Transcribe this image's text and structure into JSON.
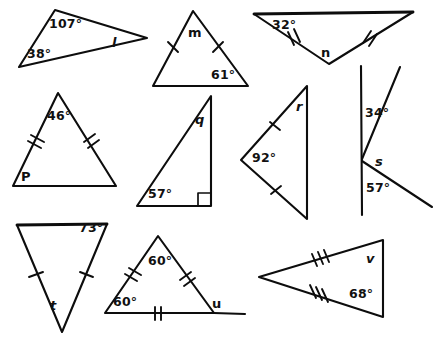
{
  "worksheet": {
    "width": 440,
    "height": 339,
    "background_color": "#ffffff",
    "ink_color": "#0d0d0d",
    "description": "Hand-drawn geometry worksheet with ten figures: nine triangles and one angle-pair diagram, each labeled with known angle measures and one unknown angle named by a letter."
  },
  "figures": [
    {
      "id": "figure-l",
      "type": "scalene-triangle",
      "unknown": "l",
      "known_angles": [
        "107°",
        "38°"
      ],
      "tick_marks": "none",
      "labels": {
        "angle_1": "107°",
        "angle_2": "38°",
        "unknown": "l"
      }
    },
    {
      "id": "figure-m",
      "type": "isosceles-triangle",
      "unknown": "m",
      "known_angles": [
        "61°"
      ],
      "tick_marks": "single on two legs",
      "labels": {
        "angle_1": "61°",
        "unknown": "m"
      }
    },
    {
      "id": "figure-n",
      "type": "isosceles-triangle",
      "unknown": "n",
      "known_angles": [
        "32°"
      ],
      "tick_marks": "double on two legs",
      "labels": {
        "angle_1": "32°",
        "unknown": "n"
      }
    },
    {
      "id": "figure-p",
      "type": "isosceles-triangle",
      "unknown": "P",
      "known_angles": [
        "46°"
      ],
      "tick_marks": "double on two legs",
      "labels": {
        "angle_1": "46°",
        "unknown": "P"
      }
    },
    {
      "id": "figure-q",
      "type": "right-triangle",
      "unknown": "q",
      "known_angles": [
        "57°",
        "90°"
      ],
      "tick_marks": "none",
      "labels": {
        "angle_1": "57°",
        "unknown": "q"
      }
    },
    {
      "id": "figure-r",
      "type": "isosceles-triangle",
      "unknown": "r",
      "known_angles": [
        "92°"
      ],
      "tick_marks": "single on two legs",
      "labels": {
        "angle_1": "92°",
        "unknown": "r"
      }
    },
    {
      "id": "figure-s",
      "type": "angles-on-a-line",
      "unknown": "s",
      "known_angles": [
        "34°",
        "57°"
      ],
      "tick_marks": "none",
      "labels": {
        "angle_1": "34°",
        "angle_2": "57°",
        "unknown": "s"
      }
    },
    {
      "id": "figure-t",
      "type": "isosceles-triangle",
      "unknown": "t",
      "known_angles": [
        "73°"
      ],
      "tick_marks": "single on two legs",
      "labels": {
        "angle_1": "73°",
        "unknown": "t"
      }
    },
    {
      "id": "figure-u",
      "type": "equilateral-triangle",
      "unknown": "u",
      "known_angles": [
        "60°",
        "60°"
      ],
      "tick_marks": "double on all three sides",
      "labels": {
        "angle_1": "60°",
        "angle_2": "60°",
        "unknown": "u"
      }
    },
    {
      "id": "figure-v",
      "type": "isosceles-triangle",
      "unknown": "v",
      "known_angles": [
        "68°"
      ],
      "tick_marks": "triple on two legs",
      "labels": {
        "angle_1": "68°",
        "unknown": "v"
      }
    }
  ]
}
